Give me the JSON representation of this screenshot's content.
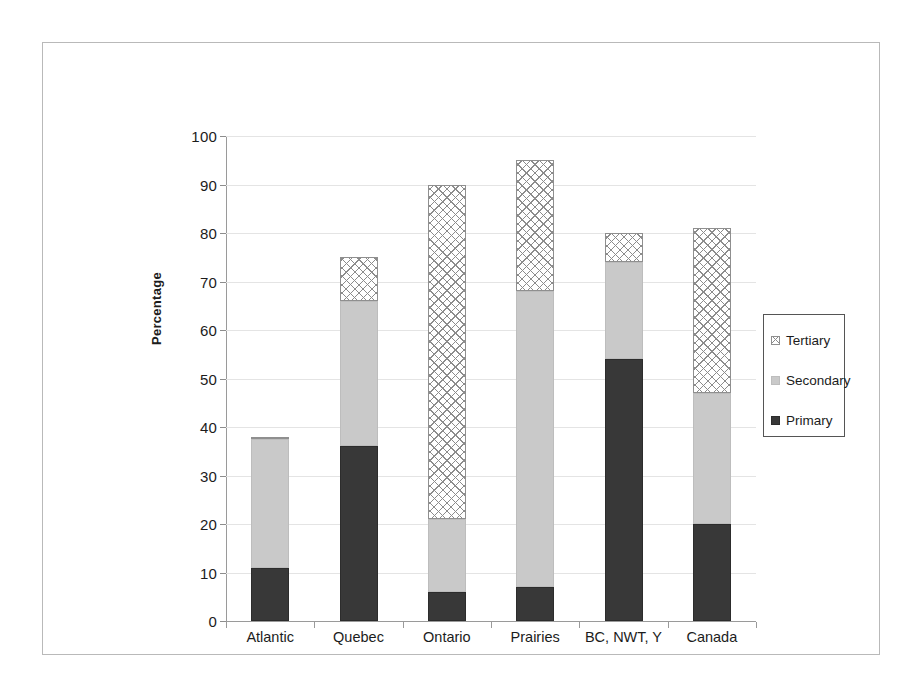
{
  "chart_data": {
    "type": "bar",
    "subtype": "stacked-bar",
    "title": "",
    "xlabel": "",
    "ylabel": "Percentage",
    "ylim": [
      0,
      100
    ],
    "ytick_step": 10,
    "yticks": [
      0,
      10,
      20,
      30,
      40,
      50,
      60,
      70,
      80,
      90,
      100
    ],
    "grid": true,
    "legend_position": "right",
    "categories": [
      "Atlantic",
      "Quebec",
      "Ontario",
      "Prairies",
      "BC, NWT, Y",
      "Canada"
    ],
    "series": [
      {
        "name": "Primary",
        "color": "#383838",
        "pattern": "solid-dark",
        "values": [
          11,
          36,
          6,
          7,
          54,
          20
        ]
      },
      {
        "name": "Secondary",
        "color": "#c9c9c9",
        "pattern": "solid-light-gray",
        "values": [
          26.5,
          30,
          15,
          61,
          20,
          27
        ]
      },
      {
        "name": "Tertiary",
        "color": "#ffffff",
        "pattern": "diagonal-crosshatch",
        "values": [
          0.5,
          9,
          69,
          27,
          6,
          34
        ]
      }
    ],
    "totals": [
      38,
      75,
      90,
      95,
      80,
      81
    ]
  },
  "axis": {
    "y_title": "Percentage",
    "y_tick_labels": [
      "100",
      "90",
      "80",
      "70",
      "60",
      "50",
      "40",
      "30",
      "20",
      "10",
      "0"
    ],
    "x_tick_labels": [
      "Atlantic",
      "Quebec",
      "Ontario",
      "Prairies",
      "BC, NWT, Y",
      "Canada"
    ]
  },
  "legend": {
    "items": [
      {
        "label": "Tertiary",
        "swatch": "crosshatch-swatch"
      },
      {
        "label": "Secondary",
        "swatch": "light-gray-swatch"
      },
      {
        "label": "Primary",
        "swatch": "dark-swatch"
      }
    ]
  },
  "colors": {
    "primary": "#383838",
    "secondary": "#c9c9c9",
    "tertiary": "#ffffff",
    "tertiary_hatch": "#8c8c8c",
    "gridline": "#e4e4e4",
    "axis": "#9a9a9a",
    "frame": "#b9b9b9",
    "text": "#1c1c1c"
  }
}
